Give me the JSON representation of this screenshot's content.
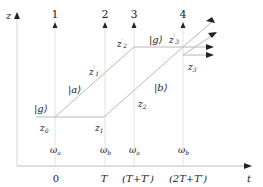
{
  "diagram": {
    "axes": {
      "vertical_label": "z",
      "horizontal_label": "t"
    },
    "pulse_markers": [
      {
        "label": "1",
        "x": 55
      },
      {
        "label": "2",
        "x": 105
      },
      {
        "label": "3",
        "x": 134
      },
      {
        "label": "4",
        "x": 183
      }
    ],
    "time_ticks": [
      {
        "label": "0",
        "x": 55
      },
      {
        "label": "T",
        "x": 104
      },
      {
        "label": "(T+T′)",
        "x": 134
      },
      {
        "label": "(2T+T′)",
        "x": 183
      }
    ],
    "frequencies": [
      {
        "label": "ωa",
        "x": 55
      },
      {
        "label": "ωb",
        "x": 104
      },
      {
        "label": "ωa",
        "x": 134
      },
      {
        "label": "ωb",
        "x": 183
      }
    ],
    "state_labels": {
      "g_left": "|g⟩",
      "a": "|a⟩",
      "b": "|b⟩",
      "g_right": "|g⟩"
    },
    "position_labels": {
      "z0": "z0",
      "z1": "z1",
      "z1p": "z′1",
      "z2": "z2",
      "z2p": "z′2",
      "z3": "z3",
      "z3p": "z′3"
    },
    "colors": {
      "path_line": "#b8b8b8",
      "axis_line": "#cccccc",
      "arrow": "#222222",
      "text": "#222222"
    }
  }
}
